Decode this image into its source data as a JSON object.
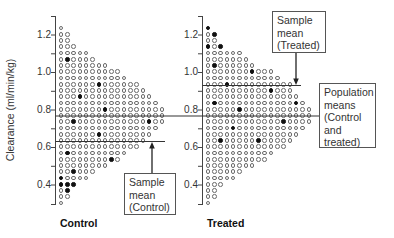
{
  "figure": {
    "y_axis_label": "Clearance (ml/min/kg)",
    "ticks": [
      "1.2",
      "1.0",
      "0.8",
      "0.6",
      "0.4"
    ],
    "panels": [
      {
        "label": "Control"
      },
      {
        "label": "Treated"
      }
    ],
    "callouts": {
      "control_mean": [
        "Sample",
        "mean",
        "(Control)"
      ],
      "treated_mean": [
        "Sample",
        "mean",
        "(Treated)"
      ],
      "population": [
        "Population",
        "means",
        "(Control",
        "and",
        "treated)"
      ]
    }
  },
  "chart_data": {
    "type": "scatter",
    "subtype": "dot-plot (each circle = one observation; filled circles = sampled observations)",
    "title": "",
    "xlabel": "",
    "ylabel": "Clearance (ml/min/kg)",
    "ylim": [
      0.3,
      1.3
    ],
    "yticks": [
      1.2,
      1.0,
      0.8,
      0.6,
      0.4
    ],
    "grid": false,
    "legend": "none (callout boxes used as annotations)",
    "row_values": [
      1.23,
      1.2,
      1.17,
      1.13,
      1.1,
      1.07,
      1.03,
      1.0,
      0.97,
      0.93,
      0.9,
      0.87,
      0.83,
      0.8,
      0.77,
      0.73,
      0.7,
      0.67,
      0.63,
      0.6,
      0.57,
      0.53,
      0.5,
      0.47,
      0.43,
      0.4,
      0.37,
      0.33,
      0.3
    ],
    "row_encoding": "o = population member (open circle), x = sampled member (filled circle)",
    "series": [
      {
        "name": "Control",
        "rows": [
          "o",
          "oo",
          "oo",
          "ooo",
          "ooooo",
          "oxoooo",
          "oooooooo",
          "oooooooooo",
          "ooooooooooo",
          "ooooooxoooooo",
          "oooooooooooooo",
          "oooxooooooooooo",
          "oooooooooooooooo",
          "oooooooxooooooooo",
          "ooooooooooooooooo",
          "ooxoooooooooooxoo",
          "oooooooooooooooo",
          "ooooooxoooooooo",
          "oooooooooooooo",
          "ooooooooooooo",
          "oxooooooooo",
          "ooooooooxo",
          "oooooooo",
          "ooxooo",
          "xoooo",
          "xxx",
          "ox",
          "oo",
          "o"
        ],
        "counts": [
          1,
          2,
          2,
          3,
          5,
          6,
          8,
          10,
          11,
          13,
          14,
          15,
          16,
          17,
          17,
          17,
          16,
          15,
          14,
          13,
          11,
          10,
          8,
          6,
          5,
          3,
          2,
          2,
          1
        ],
        "sample_mean": 0.63,
        "population_mean": 0.77
      },
      {
        "name": "Treated",
        "rows": [
          "x",
          "ox",
          "oo",
          "xox",
          "oooooo",
          "ooooooo",
          "oxoooooo",
          "oooooooxooo",
          "oooooooooooo",
          "oooxoooooooooo",
          "ooooooooooxooo",
          "ooooooooooooooo",
          "oxooooooooooooxo",
          "oooooxooooooooooo",
          "ooooooooooooooooo",
          "ooooooooooooxoooo",
          "ooooxooooooooooo",
          "ooooooooooooooo",
          "ooxoooooxooooo",
          "ooooooooooooo",
          "ooooooooooo",
          "oooooooooo",
          "oooooooo",
          "oooooo",
          "ooooo",
          "ooo",
          "oo",
          "oo",
          "o"
        ],
        "counts": [
          1,
          2,
          2,
          3,
          6,
          7,
          8,
          11,
          12,
          14,
          14,
          15,
          16,
          17,
          17,
          17,
          16,
          15,
          14,
          13,
          11,
          10,
          8,
          6,
          5,
          3,
          2,
          2,
          1
        ],
        "sample_mean": 0.93,
        "population_mean": 0.77
      }
    ],
    "annotations": [
      {
        "text": "Sample mean (Control)",
        "points_to": 0.63
      },
      {
        "text": "Sample mean (Treated)",
        "points_to": 0.93
      },
      {
        "text": "Population means (Control and treated)",
        "points_to": 0.77
      }
    ]
  }
}
